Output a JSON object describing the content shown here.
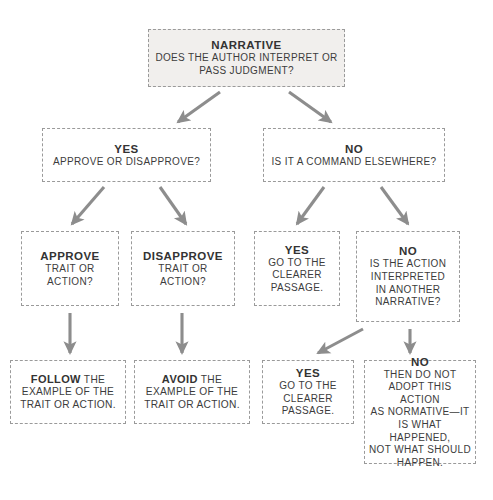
{
  "page": {
    "caption_top": "",
    "colors": {
      "background": "#ffffff",
      "border": "#9a9a9a",
      "arrow": "#8d8d8d",
      "text": "#3a3a3a",
      "heading": "#333333",
      "node_fill": "#f1efed"
    }
  },
  "nodes": {
    "narrative": {
      "heading": "NARRATIVE",
      "line1": "DOES THE AUTHOR INTERPRET OR",
      "line2": "PASS JUDGMENT?"
    },
    "yes_approve": {
      "heading": "YES",
      "line1": "APPROVE OR DISAPPROVE?"
    },
    "no_command": {
      "heading": "NO",
      "line1": "IS IT A COMMAND ELSEWHERE?"
    },
    "approve": {
      "heading": "APPROVE",
      "line1": "TRAIT OR",
      "line2": "ACTION?"
    },
    "disapprove": {
      "heading": "DISAPPROVE",
      "line1": "TRAIT OR ACTION?"
    },
    "yes_clearer_1": {
      "heading": "YES",
      "line1": "GO TO THE",
      "line2": "CLEARER",
      "line3": "PASSAGE."
    },
    "no_another_narrative": {
      "heading": "NO",
      "line1": "IS THE ACTION",
      "line2": "INTERPRETED",
      "line3": "IN ANOTHER",
      "line4": "NARRATIVE?"
    },
    "follow": {
      "lead": "FOLLOW",
      "rest_line1": " THE",
      "line2": "EXAMPLE OF THE",
      "line3": "TRAIT OR ACTION."
    },
    "avoid": {
      "lead": "AVOID",
      "rest_line1": " THE",
      "line2": "EXAMPLE OF THE",
      "line3": "TRAIT OR ACTION."
    },
    "yes_clearer_2": {
      "heading": "YES",
      "line1": "GO TO THE",
      "line2": "CLEARER",
      "line3": "PASSAGE."
    },
    "no_adopt": {
      "heading": "NO",
      "line1": "THEN DO NOT",
      "line2": "ADOPT THIS ACTION",
      "line3": "AS NORMATIVE—IT",
      "line4": "IS WHAT HAPPENED,",
      "line5": "NOT WHAT SHOULD",
      "line6": "HAPPEN."
    }
  }
}
